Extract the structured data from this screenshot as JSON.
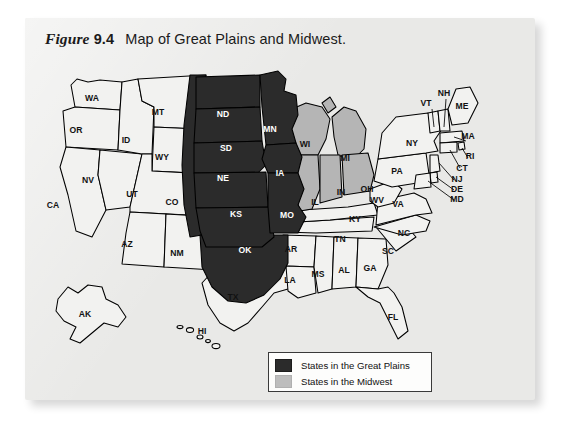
{
  "figure": {
    "label": "Figure",
    "number": "9.4",
    "caption": "Map of Great Plains and Midwest."
  },
  "legend": {
    "items": [
      {
        "label": "States in the Great Plains",
        "swatch": "dark",
        "color": "#2b2b2b"
      },
      {
        "label": "States in the Midwest",
        "swatch": "gray",
        "color": "#bdbdbd"
      }
    ]
  },
  "colors": {
    "great_plains": "#2b2b2b",
    "midwest": "#b5b5b5",
    "other_states": "#f2f2f0",
    "panel_background": "#e9e9e7",
    "outline": "#000000"
  },
  "map": {
    "title": "United States state map",
    "categories": {
      "great_plains": [
        "ND",
        "SD",
        "NE",
        "KS",
        "OK",
        "MN",
        "IA",
        "MO"
      ],
      "midwest": [
        "WI",
        "MI",
        "IL",
        "IN",
        "OH"
      ],
      "unshaded": [
        "WA",
        "OR",
        "CA",
        "NV",
        "ID",
        "MT",
        "WY",
        "UT",
        "CO",
        "AZ",
        "NM",
        "TX",
        "AR",
        "LA",
        "MS",
        "AL",
        "TN",
        "KY",
        "GA",
        "FL",
        "SC",
        "NC",
        "VA",
        "WV",
        "PA",
        "NY",
        "MD",
        "DE",
        "NJ",
        "CT",
        "RI",
        "MA",
        "VT",
        "NH",
        "ME",
        "AK",
        "HI"
      ]
    },
    "labels": [
      {
        "abbr": "WA",
        "x": 62,
        "y": 46,
        "shade": "none"
      },
      {
        "abbr": "OR",
        "x": 46,
        "y": 78,
        "shade": "none"
      },
      {
        "abbr": "CA",
        "x": 23,
        "y": 153,
        "shade": "none"
      },
      {
        "abbr": "NV",
        "x": 58,
        "y": 128,
        "shade": "none"
      },
      {
        "abbr": "ID",
        "x": 96,
        "y": 88,
        "shade": "none"
      },
      {
        "abbr": "MT",
        "x": 128,
        "y": 60,
        "shade": "none"
      },
      {
        "abbr": "WY",
        "x": 132,
        "y": 105,
        "shade": "none"
      },
      {
        "abbr": "UT",
        "x": 102,
        "y": 142,
        "shade": "none"
      },
      {
        "abbr": "CO",
        "x": 142,
        "y": 150,
        "shade": "none"
      },
      {
        "abbr": "AZ",
        "x": 97,
        "y": 192,
        "shade": "none"
      },
      {
        "abbr": "NM",
        "x": 147,
        "y": 201,
        "shade": "none"
      },
      {
        "abbr": "TX",
        "x": 203,
        "y": 245,
        "shade": "none"
      },
      {
        "abbr": "ND",
        "x": 193,
        "y": 62,
        "shade": "dark"
      },
      {
        "abbr": "SD",
        "x": 196,
        "y": 96,
        "shade": "dark"
      },
      {
        "abbr": "NE",
        "x": 193,
        "y": 126,
        "shade": "dark"
      },
      {
        "abbr": "KS",
        "x": 206,
        "y": 162,
        "shade": "dark"
      },
      {
        "abbr": "OK",
        "x": 215,
        "y": 198,
        "shade": "dark"
      },
      {
        "abbr": "MN",
        "x": 240,
        "y": 77,
        "shade": "dark"
      },
      {
        "abbr": "IA",
        "x": 250,
        "y": 121,
        "shade": "dark"
      },
      {
        "abbr": "MO",
        "x": 257,
        "y": 163,
        "shade": "dark"
      },
      {
        "abbr": "AR",
        "x": 261,
        "y": 197,
        "shade": "none"
      },
      {
        "abbr": "LA",
        "x": 260,
        "y": 228,
        "shade": "none"
      },
      {
        "abbr": "WI",
        "x": 275,
        "y": 92,
        "shade": "none"
      },
      {
        "abbr": "MI",
        "x": 315,
        "y": 106,
        "shade": "none"
      },
      {
        "abbr": "IL",
        "x": 285,
        "y": 150,
        "shade": "none"
      },
      {
        "abbr": "IN",
        "x": 311,
        "y": 140,
        "shade": "none"
      },
      {
        "abbr": "OH",
        "x": 337,
        "y": 137,
        "shade": "none"
      },
      {
        "abbr": "KY",
        "x": 325,
        "y": 167,
        "shade": "none"
      },
      {
        "abbr": "TN",
        "x": 310,
        "y": 187,
        "shade": "none"
      },
      {
        "abbr": "MS",
        "x": 288,
        "y": 222,
        "shade": "none"
      },
      {
        "abbr": "AL",
        "x": 314,
        "y": 218,
        "shade": "none"
      },
      {
        "abbr": "GA",
        "x": 340,
        "y": 216,
        "shade": "none"
      },
      {
        "abbr": "FL",
        "x": 363,
        "y": 265,
        "shade": "none"
      },
      {
        "abbr": "SC",
        "x": 358,
        "y": 199,
        "shade": "none"
      },
      {
        "abbr": "NC",
        "x": 374,
        "y": 181,
        "shade": "none"
      },
      {
        "abbr": "VA",
        "x": 368,
        "y": 152,
        "shade": "none"
      },
      {
        "abbr": "WV",
        "x": 347,
        "y": 148,
        "shade": "none"
      },
      {
        "abbr": "PA",
        "x": 367,
        "y": 119,
        "shade": "none"
      },
      {
        "abbr": "NY",
        "x": 382,
        "y": 91,
        "shade": "none"
      },
      {
        "abbr": "VT",
        "x": 396,
        "y": 51,
        "shade": "none"
      },
      {
        "abbr": "NH",
        "x": 414,
        "y": 41,
        "shade": "none"
      },
      {
        "abbr": "ME",
        "x": 432,
        "y": 54,
        "shade": "none"
      },
      {
        "abbr": "MA",
        "x": 438,
        "y": 84,
        "shade": "none"
      },
      {
        "abbr": "RI",
        "x": 440,
        "y": 104,
        "shade": "none"
      },
      {
        "abbr": "CT",
        "x": 432,
        "y": 116,
        "shade": "none"
      },
      {
        "abbr": "NJ",
        "x": 427,
        "y": 127,
        "shade": "none"
      },
      {
        "abbr": "DE",
        "x": 427,
        "y": 137,
        "shade": "none"
      },
      {
        "abbr": "MD",
        "x": 427,
        "y": 147,
        "shade": "none"
      },
      {
        "abbr": "AK",
        "x": 55,
        "y": 262,
        "shade": "none"
      },
      {
        "abbr": "HI",
        "x": 172,
        "y": 279,
        "shade": "none"
      }
    ]
  }
}
